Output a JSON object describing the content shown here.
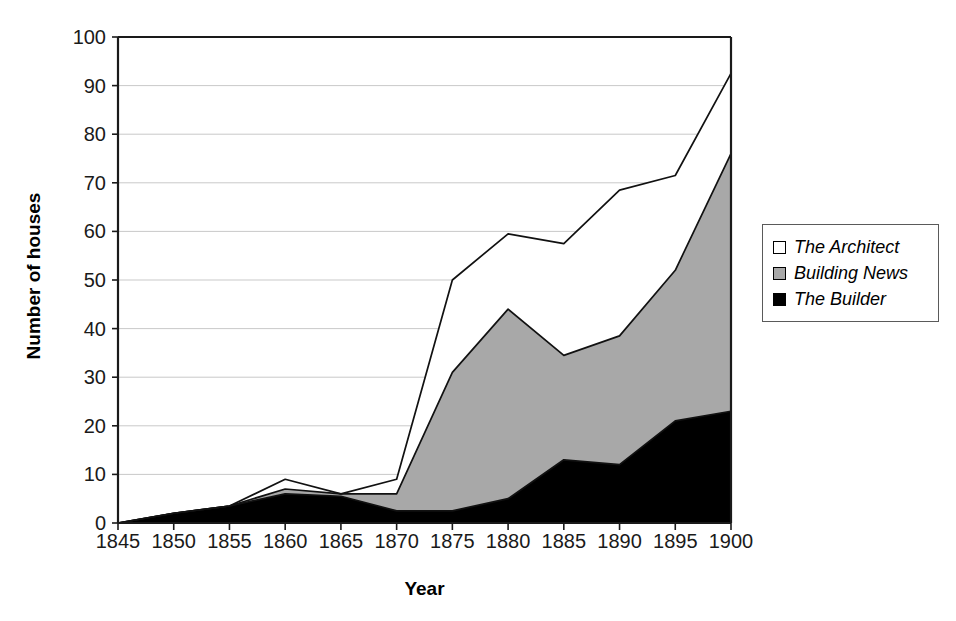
{
  "chart_data": {
    "type": "area",
    "stacked": true,
    "title": "",
    "xlabel": "Year",
    "ylabel": "Number of houses",
    "categories": [
      1845,
      1850,
      1855,
      1860,
      1865,
      1870,
      1875,
      1880,
      1885,
      1890,
      1895,
      1900
    ],
    "xtick_labels": [
      "1845",
      "1850",
      "1855",
      "1860",
      "1865",
      "1870",
      "1875",
      "1880",
      "1885",
      "1890",
      "1895",
      "1900"
    ],
    "ytick_labels": [
      "0",
      "10",
      "20",
      "30",
      "40",
      "50",
      "60",
      "70",
      "80",
      "90",
      "100"
    ],
    "ylim": [
      0,
      100
    ],
    "xlim": [
      1845,
      1900
    ],
    "ytick_step": 10,
    "grid": "horizontal",
    "legend_position": "right",
    "series": [
      {
        "name": "The Builder",
        "color": "#000000",
        "values": [
          0,
          2,
          3.5,
          6,
          5.5,
          2.5,
          2.5,
          5,
          13,
          12,
          21,
          23
        ]
      },
      {
        "name": "Building News",
        "color": "#a8a8a8",
        "values": [
          0,
          0,
          0,
          1,
          0.5,
          3.5,
          28.5,
          39,
          21.5,
          26.5,
          31,
          53
        ]
      },
      {
        "name": "The Architect",
        "color": "#ffffff",
        "values": [
          0,
          0,
          0,
          2,
          0,
          3,
          19,
          15.5,
          23,
          30,
          19.5,
          16.5
        ]
      }
    ],
    "cumulative": {
      "builder": [
        0,
        2,
        3.5,
        6,
        5.5,
        2.5,
        2.5,
        5,
        13,
        12,
        21,
        23
      ],
      "builder_plus_building_news": [
        0,
        2,
        3.5,
        7,
        6,
        6,
        31,
        44,
        34.5,
        38.5,
        52,
        76
      ],
      "total": [
        0,
        2,
        3.5,
        9,
        6,
        9,
        50,
        59.5,
        57.5,
        68.5,
        71.5,
        92.5
      ]
    }
  },
  "axes": {
    "y_title": "Number of houses",
    "x_title": "Year"
  },
  "legend": {
    "items": [
      {
        "label": "The Architect",
        "swatch": "#ffffff"
      },
      {
        "label": "Building News",
        "swatch": "#a8a8a8"
      },
      {
        "label": "The Builder",
        "swatch": "#000000"
      }
    ]
  }
}
